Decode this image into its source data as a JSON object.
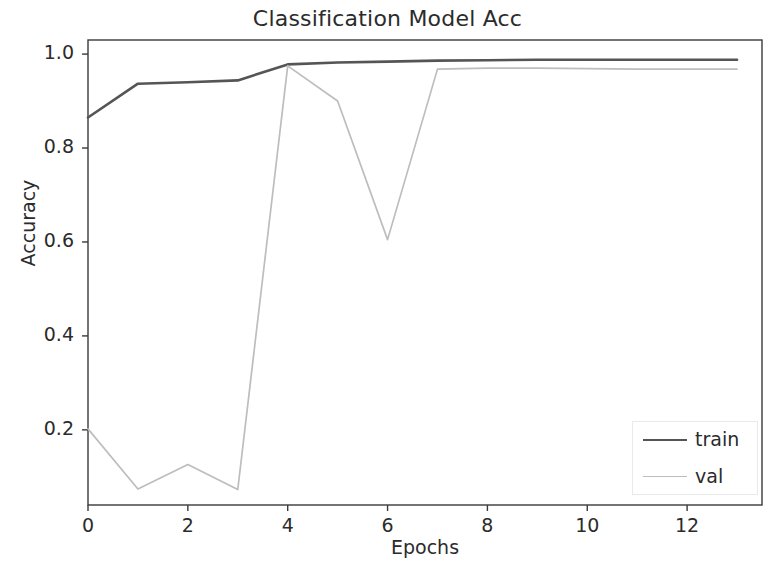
{
  "chart_data": {
    "type": "line",
    "title": "Classification Model Acc",
    "xlabel": "Epochs",
    "ylabel": "Accuracy",
    "x": [
      0,
      1,
      2,
      3,
      4,
      5,
      6,
      7,
      8,
      9,
      10,
      11,
      12,
      13
    ],
    "series": [
      {
        "name": "train",
        "color": "#555555",
        "linewidth": 2.6,
        "values": [
          0.865,
          0.937,
          0.94,
          0.944,
          0.978,
          0.982,
          0.984,
          0.986,
          0.987,
          0.988,
          0.988,
          0.988,
          0.988,
          0.988
        ]
      },
      {
        "name": "val",
        "color": "#bdbdbd",
        "linewidth": 1.7,
        "values": [
          0.202,
          0.074,
          0.126,
          0.073,
          0.975,
          0.9,
          0.605,
          0.968,
          0.97,
          0.97,
          0.969,
          0.968,
          0.968,
          0.968
        ]
      }
    ],
    "xlim": [
      0,
      13.5
    ],
    "ylim": [
      0.04,
      1.03
    ],
    "xticks": [
      0,
      2,
      4,
      6,
      8,
      10,
      12
    ],
    "xtick_labels": [
      "0",
      "2",
      "4",
      "6",
      "8",
      "10",
      "12"
    ],
    "yticks": [
      0.2,
      0.4,
      0.6,
      0.8,
      1.0
    ],
    "ytick_labels": [
      "0.2",
      "0.4",
      "0.6",
      "0.8",
      "1.0"
    ],
    "grid": false,
    "legend_position": "lower right",
    "legend_entries": [
      "train",
      "val"
    ]
  },
  "axes": {
    "frame_color": "#3a3a3a"
  }
}
